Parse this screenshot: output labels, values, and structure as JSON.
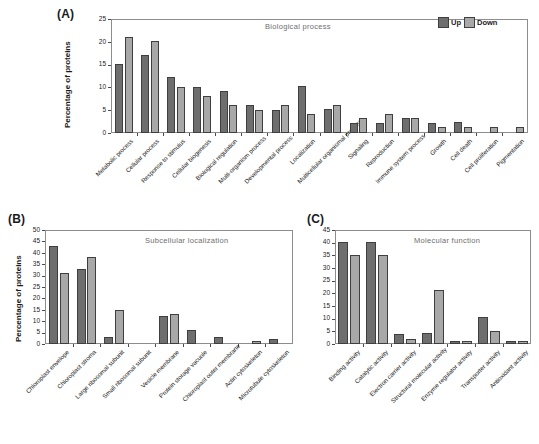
{
  "figure": {
    "legend": {
      "up_label": "Up",
      "down_label": "Down"
    },
    "colors": {
      "up": "#6e6e6e",
      "down": "#a8a8a8",
      "axis": "#4a4a4a",
      "title": "#6e6e6e"
    }
  },
  "panels": {
    "a": {
      "tag": "(A)",
      "title": "Biological process",
      "ylabel": "Percentage of proteins"
    },
    "b": {
      "tag": "(B)",
      "title": "Subcellular localization",
      "ylabel": "Percentage of proteins"
    },
    "c": {
      "tag": "(C)",
      "title": "Molecular function",
      "ylabel": ""
    }
  },
  "chart_data": [
    {
      "id": "a",
      "type": "bar",
      "title": "Biological process",
      "xlabel": "",
      "ylabel": "Percentage of proteins",
      "ylim": [
        0,
        25
      ],
      "yticks": [
        0,
        5,
        10,
        15,
        20,
        25
      ],
      "grid": false,
      "legend": [
        "Up",
        "Down"
      ],
      "legend_position": "top-right",
      "categories": [
        "Metabolic process",
        "Cellular process",
        "Response to stimulus",
        "Cellular biogenesis",
        "Biological regulation",
        "Multi-organism process",
        "Developmental process",
        "Localization",
        "Multicellular organismal process",
        "Signaling",
        "Reproduction",
        "Immune system process",
        "Growth",
        "Cell death",
        "Cell proliferation",
        "Pigmentation"
      ],
      "series": [
        {
          "name": "Up",
          "values": [
            15.1,
            17.1,
            12.2,
            10.1,
            9.2,
            6.1,
            5.1,
            10.2,
            5.2,
            2.2,
            2.3,
            3.3,
            2.3,
            2.4,
            0,
            0
          ]
        },
        {
          "name": "Down",
          "values": [
            21.1,
            20.1,
            10.1,
            8.1,
            6.1,
            5.0,
            6.1,
            4.2,
            6.2,
            3.2,
            4.2,
            3.3,
            1.3,
            1.3,
            1.4,
            1.4
          ]
        }
      ]
    },
    {
      "id": "b",
      "type": "bar",
      "title": "Subcellular localization",
      "xlabel": "",
      "ylabel": "Percentage of proteins",
      "ylim": [
        0,
        50
      ],
      "yticks": [
        0,
        5,
        10,
        15,
        20,
        25,
        30,
        35,
        40,
        45,
        50
      ],
      "grid": false,
      "legend": [
        "Up",
        "Down"
      ],
      "categories": [
        "Chloroplast envelope",
        "Chloroplast stroma",
        "Large ribosomal subunit",
        "Small ribosomal subunit",
        "Vesicle membrane",
        "Protein storage vacuole",
        "Chloroplast outer membrane",
        "Actin cytoskeleton",
        "Microtubule cytoskeleton"
      ],
      "series": [
        {
          "name": "Up",
          "values": [
            43.1,
            33.1,
            3.1,
            0,
            12.4,
            6.3,
            3.2,
            0,
            2.2
          ]
        },
        {
          "name": "Down",
          "values": [
            31.0,
            38.1,
            15.1,
            0,
            13.1,
            0,
            0,
            1.1,
            0
          ]
        }
      ]
    },
    {
      "id": "c",
      "type": "bar",
      "title": "Molecular function",
      "xlabel": "",
      "ylabel": "",
      "ylim": [
        0,
        45
      ],
      "yticks": [
        0,
        5,
        10,
        15,
        20,
        25,
        30,
        35,
        40,
        45
      ],
      "grid": false,
      "legend": [
        "Up",
        "Down"
      ],
      "categories": [
        "Binding activity",
        "Catalytic activity",
        "Electron carrier activity",
        "Structural molecular activity",
        "Enzyme regulator activity",
        "Transporter activity",
        "Antioxidant activity"
      ],
      "series": [
        {
          "name": "Up",
          "values": [
            40.2,
            40.3,
            4.1,
            4.3,
            1.1,
            10.5,
            1.2
          ]
        },
        {
          "name": "Down",
          "values": [
            35.0,
            35.2,
            2.1,
            21.3,
            1.1,
            5.3,
            1.2
          ]
        }
      ]
    }
  ]
}
